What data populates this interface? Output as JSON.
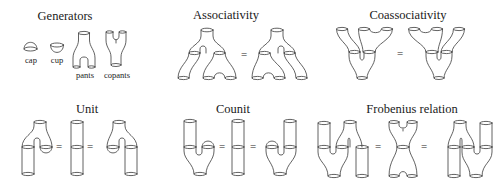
{
  "figure": {
    "panels": [
      {
        "id": "generators",
        "title": "Generators",
        "items": [
          {
            "name": "cap",
            "label": "cap"
          },
          {
            "name": "cup",
            "label": "cup"
          },
          {
            "name": "pants",
            "label": "pants"
          },
          {
            "name": "copants",
            "label": "copants"
          }
        ]
      },
      {
        "id": "associativity",
        "title": "Associativity",
        "equals": [
          "="
        ]
      },
      {
        "id": "coassociativity",
        "title": "Coassociativity",
        "equals": [
          "="
        ]
      },
      {
        "id": "unit",
        "title": "Unit",
        "equals": [
          "=",
          "="
        ]
      },
      {
        "id": "counit",
        "title": "Counit",
        "equals": [
          "=",
          "="
        ]
      },
      {
        "id": "frobenius",
        "title": "Frobenius relation",
        "equals": [
          "=",
          "="
        ]
      }
    ]
  },
  "colors": {
    "background": "#ffffff",
    "stroke": "#3a3a3a",
    "text": "#1a1a1a"
  }
}
